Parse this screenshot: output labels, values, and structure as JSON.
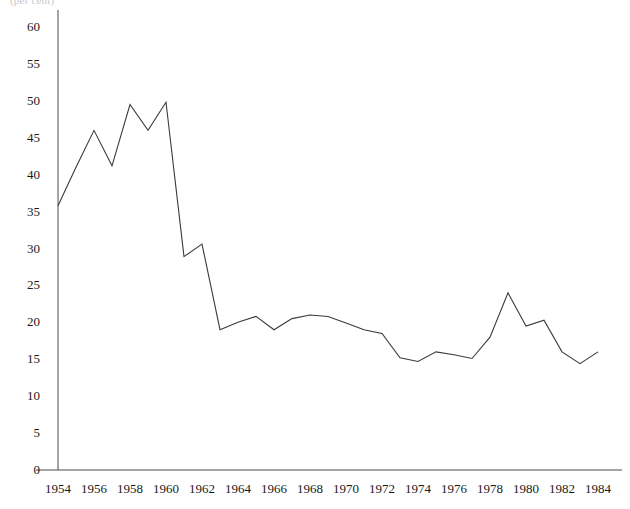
{
  "page": {
    "clipped_header_text": "(per cent)"
  },
  "chart_data": {
    "type": "line",
    "title": "",
    "subtitle": "",
    "xlabel": "",
    "ylabel": "",
    "xlim": [
      1954,
      1984
    ],
    "ylim": [
      0,
      60
    ],
    "grid": false,
    "legend": false,
    "legend_position": "none",
    "y_ticks": [
      0,
      5,
      10,
      15,
      20,
      25,
      30,
      35,
      40,
      45,
      50,
      55,
      60
    ],
    "y_tick_labels": [
      "0",
      "5",
      "10",
      "15",
      "20",
      "25",
      "30",
      "35",
      "40",
      "45",
      "50",
      "55",
      "60"
    ],
    "x_ticks": [
      1954,
      1956,
      1958,
      1960,
      1962,
      1964,
      1966,
      1968,
      1970,
      1972,
      1974,
      1976,
      1978,
      1980,
      1982,
      1984
    ],
    "x_tick_labels": [
      "1954",
      "1956",
      "1958",
      "1960",
      "1962",
      "1964",
      "1966",
      "1968",
      "1970",
      "1972",
      "1974",
      "1976",
      "1978",
      "1980",
      "1982",
      "1984"
    ],
    "line_color": "#3a3a3a",
    "axis_color": "#4a4a4a",
    "x": [
      1954,
      1955,
      1956,
      1957,
      1958,
      1959,
      1960,
      1961,
      1962,
      1963,
      1964,
      1965,
      1966,
      1967,
      1968,
      1969,
      1970,
      1971,
      1972,
      1973,
      1974,
      1975,
      1976,
      1977,
      1978,
      1979,
      1980,
      1981,
      1982,
      1983,
      1984
    ],
    "series": [
      {
        "name": "value",
        "values": [
          35.8,
          41.0,
          46.0,
          41.2,
          49.5,
          46.0,
          49.8,
          28.9,
          30.6,
          19.0,
          20.0,
          20.8,
          19.0,
          20.5,
          21.0,
          20.8,
          19.9,
          19.0,
          18.5,
          15.2,
          14.7,
          16.0,
          15.6,
          15.1,
          18.0,
          24.0,
          19.5,
          20.3,
          16.0,
          14.4,
          16.0
        ]
      }
    ]
  }
}
